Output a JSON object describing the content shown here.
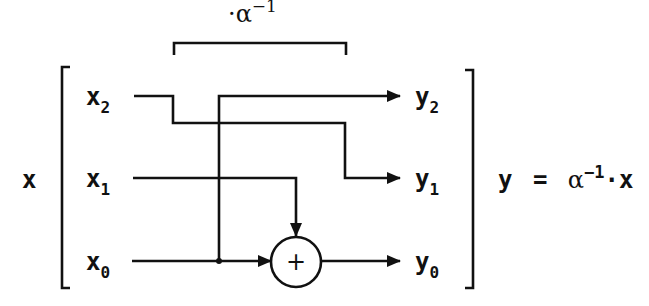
{
  "diagram": {
    "top_label": "·α⁻¹",
    "top_label_parts": {
      "dot": "·",
      "alpha": "α",
      "exp": "−1"
    },
    "input_vector": {
      "name": "x",
      "elements": [
        {
          "base": "x",
          "sub": "2"
        },
        {
          "base": "x",
          "sub": "1"
        },
        {
          "base": "x",
          "sub": "0"
        }
      ]
    },
    "output_vector": {
      "name": "y",
      "elements": [
        {
          "base": "y",
          "sub": "2"
        },
        {
          "base": "y",
          "sub": "1"
        },
        {
          "base": "y",
          "sub": "0"
        }
      ]
    },
    "adder_symbol": "+",
    "equation": {
      "lhs": "y",
      "eq": "=",
      "alpha": "α",
      "exp": "−1",
      "dot_x": "·x"
    },
    "connections": [
      {
        "from": "x2",
        "to": "y1"
      },
      {
        "from": "x1",
        "to": "adder"
      },
      {
        "from": "x0",
        "to": "adder"
      },
      {
        "from": "x0",
        "to": "y2"
      },
      {
        "from": "adder",
        "to": "y0"
      }
    ],
    "colors": {
      "ink": "#111111",
      "background": "#ffffff"
    }
  }
}
